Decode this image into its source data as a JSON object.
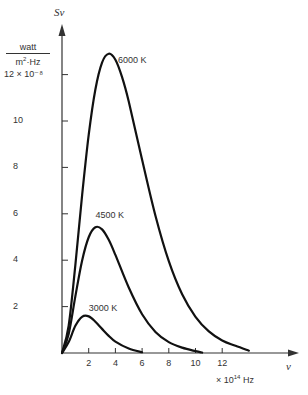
{
  "chart_data": {
    "type": "line",
    "title": "",
    "xlabel": "ν",
    "x_unit": "× 10¹⁴ Hz",
    "ylabel": "Sν",
    "y_unit_numerator": "watt",
    "y_unit_denominator": "m²·Hz",
    "y_scale_label": "12 × 10⁻⁸",
    "xlim": [
      0,
      16
    ],
    "ylim": [
      0,
      14
    ],
    "x_ticks": [
      2,
      4,
      6,
      8,
      10,
      12
    ],
    "y_ticks": [
      2,
      4,
      6,
      8,
      10,
      12
    ],
    "y_tick_labels": [
      "2",
      "4",
      "6",
      "8",
      "10",
      "12 × 10⁻⁸"
    ],
    "grid": false,
    "legend": "inline labels at curve peaks",
    "series": [
      {
        "name": "6000 K",
        "x": [
          0,
          0.5,
          1,
          1.5,
          2,
          2.5,
          3,
          3.5,
          4,
          4.5,
          5,
          6,
          7,
          8,
          9,
          10,
          11,
          12,
          13,
          14
        ],
        "values": [
          0,
          1.18,
          3.79,
          6.76,
          9.4,
          11.36,
          12.52,
          12.9,
          12.64,
          11.89,
          10.84,
          8.33,
          5.92,
          3.96,
          2.53,
          1.56,
          0.93,
          0.54,
          0.31,
          0.1
        ]
      },
      {
        "name": "4500 K",
        "x": [
          0,
          0.5,
          1,
          1.5,
          2,
          2.5,
          3,
          3.5,
          4,
          5,
          6,
          7,
          8,
          9,
          10,
          10.5
        ],
        "values": [
          0,
          0.82,
          2.44,
          3.97,
          4.99,
          5.42,
          5.33,
          4.88,
          4.23,
          2.82,
          1.67,
          0.91,
          0.47,
          0.23,
          0.08,
          0.02
        ]
      },
      {
        "name": "3000 K",
        "x": [
          0,
          0.5,
          1,
          1.5,
          2,
          2.5,
          3,
          3.5,
          4,
          5,
          6
        ],
        "values": [
          0,
          0.47,
          1.17,
          1.56,
          1.58,
          1.35,
          1.04,
          0.74,
          0.49,
          0.19,
          0.03
        ]
      }
    ],
    "annotations": [
      {
        "text": "6000 K",
        "x": 4.2,
        "y": 12.6
      },
      {
        "text": "4500 K",
        "x": 2.5,
        "y": 5.9
      },
      {
        "text": "3000 K",
        "x": 2.0,
        "y": 1.9
      }
    ]
  },
  "labels": {
    "y_symbol": "Sν",
    "unit_num": "watt",
    "unit_den": "m²·Hz",
    "x_symbol": "ν",
    "x_unit": "× 10¹⁴ Hz"
  }
}
